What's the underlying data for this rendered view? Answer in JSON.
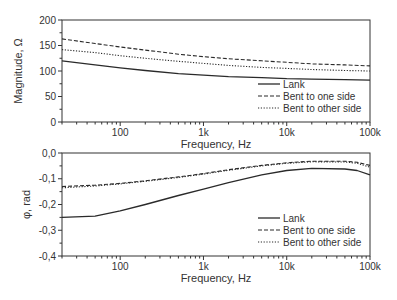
{
  "chart_data": [
    {
      "type": "line",
      "title": "",
      "xlabel": "Frequency, Hz",
      "ylabel": "Magnitude, Ω",
      "xscale": "log",
      "xlim": [
        20,
        100000
      ],
      "ylim": [
        0,
        200
      ],
      "xticks": [
        100,
        1000,
        10000,
        100000
      ],
      "xtick_labels": [
        "100",
        "1k",
        "10k",
        "100k"
      ],
      "yticks": [
        0,
        50,
        100,
        150,
        200
      ],
      "ytick_labels": [
        "0",
        "50",
        "100",
        "150",
        "200"
      ],
      "grid": false,
      "legend_position": "lower right",
      "x": [
        20,
        50,
        100,
        200,
        500,
        1000,
        2000,
        5000,
        10000,
        20000,
        50000,
        100000
      ],
      "series": [
        {
          "name": "Lank",
          "style": "solid",
          "values": [
            120,
            112,
            106,
            101,
            95,
            92,
            89,
            87,
            85,
            84,
            83,
            82
          ]
        },
        {
          "name": "Bent to one side",
          "style": "dashed",
          "values": [
            163,
            154,
            147,
            141,
            133,
            128,
            124,
            120,
            117,
            114,
            112,
            110
          ]
        },
        {
          "name": "Bent to other side",
          "style": "dotted",
          "values": [
            142,
            136,
            130,
            125,
            119,
            115,
            111,
            107,
            105,
            103,
            101,
            100
          ]
        }
      ]
    },
    {
      "type": "line",
      "title": "",
      "xlabel": "Frequency, Hz",
      "ylabel": "φ, rad",
      "xscale": "log",
      "xlim": [
        20,
        100000
      ],
      "ylim": [
        -0.4,
        0.0
      ],
      "xticks": [
        100,
        1000,
        10000,
        100000
      ],
      "xtick_labels": [
        "100",
        "1k",
        "10k",
        "100k"
      ],
      "yticks": [
        -0.4,
        -0.3,
        -0.2,
        -0.1,
        0.0
      ],
      "ytick_labels": [
        "-0,4",
        "-0,3",
        "-0,2",
        "-0,1",
        "0,0"
      ],
      "grid": false,
      "legend_position": "lower right",
      "x": [
        20,
        50,
        100,
        200,
        500,
        1000,
        2000,
        5000,
        10000,
        20000,
        50000,
        70000,
        100000
      ],
      "series": [
        {
          "name": "Lank",
          "style": "solid",
          "values": [
            -0.25,
            -0.245,
            -0.225,
            -0.2,
            -0.165,
            -0.14,
            -0.115,
            -0.085,
            -0.068,
            -0.06,
            -0.062,
            -0.068,
            -0.085
          ]
        },
        {
          "name": "Bent to one side",
          "style": "dashed",
          "values": [
            -0.13,
            -0.125,
            -0.118,
            -0.108,
            -0.093,
            -0.08,
            -0.065,
            -0.048,
            -0.038,
            -0.032,
            -0.032,
            -0.036,
            -0.048
          ]
        },
        {
          "name": "Bent to other side",
          "style": "dotted",
          "values": [
            -0.135,
            -0.128,
            -0.12,
            -0.11,
            -0.095,
            -0.082,
            -0.067,
            -0.05,
            -0.04,
            -0.034,
            -0.035,
            -0.04,
            -0.055
          ]
        }
      ]
    }
  ],
  "legend": {
    "items": [
      "Lank",
      "Bent to one side",
      "Bent to other side"
    ]
  }
}
